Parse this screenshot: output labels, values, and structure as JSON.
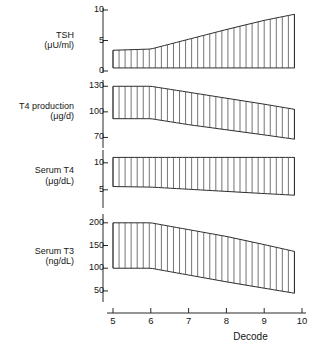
{
  "figure": {
    "xlabel": "Decode",
    "x_axis": {
      "min": 5,
      "max": 10,
      "ticks": [
        5,
        6,
        7,
        8,
        9,
        10
      ]
    }
  },
  "chart_data": {
    "type": "area",
    "title": "",
    "xlabel": "Decode",
    "xlim": [
      5,
      10
    ],
    "x_ticks": [
      5,
      6,
      7,
      8,
      9,
      10
    ],
    "grid": false,
    "legend": "none",
    "panels": [
      {
        "name": "tsh",
        "ylabel": "TSH",
        "unit": "(μU/ml)",
        "ylim": [
          0,
          10
        ],
        "y_ticks": [
          0,
          5,
          10
        ],
        "x": [
          5,
          6,
          7,
          8,
          9,
          9.8
        ],
        "upper": [
          3.4,
          3.6,
          5.2,
          6.8,
          8.3,
          9.3
        ],
        "lower": [
          0.5,
          0.5,
          0.5,
          0.5,
          0.5,
          0.5
        ]
      },
      {
        "name": "t4-production",
        "ylabel": "T4 production",
        "unit": "(μg/d)",
        "ylim": [
          60,
          135
        ],
        "y_ticks": [
          70,
          100,
          130
        ],
        "x": [
          5,
          6,
          7,
          8,
          9,
          9.8
        ],
        "upper": [
          130,
          130,
          123,
          116,
          109,
          103
        ],
        "lower": [
          92,
          92,
          85,
          79,
          73,
          68
        ]
      },
      {
        "name": "serum-t4",
        "ylabel": "Serum T4",
        "unit": "(μg/dL)",
        "ylim": [
          2,
          12
        ],
        "y_ticks": [
          5,
          10
        ],
        "x": [
          5,
          6,
          7,
          8,
          9,
          9.8
        ],
        "upper": [
          11.0,
          11.0,
          11.0,
          11.0,
          11.0,
          11.0
        ],
        "lower": [
          5.6,
          5.5,
          5.1,
          4.7,
          4.3,
          4.0
        ]
      },
      {
        "name": "serum-t3",
        "ylabel": "Serum T3",
        "unit": "(ng/dL)",
        "ylim": [
          30,
          215
        ],
        "y_ticks": [
          50,
          100,
          150,
          200
        ],
        "x": [
          5,
          6,
          7,
          8,
          9,
          9.8
        ],
        "upper": [
          200,
          200,
          185,
          170,
          152,
          137
        ],
        "lower": [
          100,
          100,
          85,
          70,
          56,
          45
        ]
      }
    ]
  }
}
